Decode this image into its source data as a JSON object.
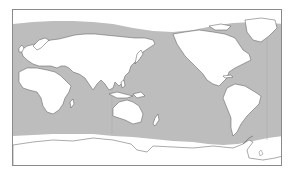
{
  "map": {
    "projection": "equirectangular, Pacific-centered",
    "colors": {
      "ocean": "#bdbdbd",
      "land": "#ffffff",
      "ice": "#ffffff",
      "coastline": "#555555",
      "frame": "#8a8a8a",
      "meridian": "#9a9a9a"
    },
    "regions": [
      "Europe",
      "Africa",
      "Asia",
      "Australia",
      "North America",
      "South America",
      "Greenland",
      "Antarctica",
      "Pacific Ocean",
      "Atlantic Ocean",
      "Indian Ocean"
    ],
    "text_labels": []
  }
}
